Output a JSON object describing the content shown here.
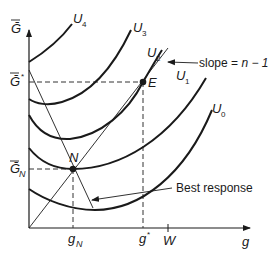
{
  "diagram": {
    "type": "economics-indifference-curve-diagram",
    "axes": {
      "x_label": "g",
      "y_label": "Ḡ",
      "x_ticks": [
        {
          "label": "g",
          "sub": "N",
          "x": 73
        },
        {
          "label": "g",
          "sup": "*",
          "x": 143
        },
        {
          "label": "W",
          "x": 168
        }
      ],
      "y_ticks": [
        {
          "label": "Ḡ",
          "sup": "*",
          "y": 82
        },
        {
          "label": "Ḡ",
          "sub": "N",
          "y": 169
        }
      ]
    },
    "curves": [
      {
        "name": "U",
        "sub": "4"
      },
      {
        "name": "U",
        "sub": "3"
      },
      {
        "name": "U",
        "sub": "2"
      },
      {
        "name": "U",
        "sub": "1"
      },
      {
        "name": "U",
        "sub": "0"
      }
    ],
    "points": [
      {
        "label": "N"
      },
      {
        "label": "E"
      }
    ],
    "annotations": {
      "slope_label": "slope = ",
      "slope_value": "n − 1",
      "best_response_label": "Best response"
    }
  }
}
